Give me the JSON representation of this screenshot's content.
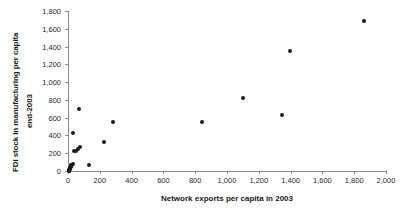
{
  "chart_data": {
    "type": "scatter",
    "title": "",
    "xlabel": "Network exports per capita in 2003",
    "ylabel_line1": "FDI stock in manufacturing per capita",
    "ylabel_line2": "end-2003",
    "xlim": [
      0,
      2000
    ],
    "ylim": [
      0,
      1800
    ],
    "xticks": [
      0,
      200,
      400,
      600,
      800,
      1000,
      1200,
      1400,
      1600,
      1800,
      2000
    ],
    "xticklabels": [
      "0",
      "200",
      "400",
      "600",
      "800",
      "1,000",
      "1,200",
      "1,400",
      "1,600",
      "1,800",
      "2,000"
    ],
    "yticks": [
      0,
      200,
      400,
      600,
      800,
      1000,
      1200,
      1400,
      1600,
      1800
    ],
    "yticklabels": [
      "0",
      "200",
      "400",
      "600",
      "800",
      "1,000",
      "1,200",
      "1,400",
      "1,600",
      "1,800"
    ],
    "grid": false,
    "legend": false,
    "marker": "filled-circle",
    "marker_color": "#1a1a1a",
    "points": [
      {
        "x": 1860,
        "y": 1690
      },
      {
        "x": 1395,
        "y": 1345
      },
      {
        "x": 1100,
        "y": 825
      },
      {
        "x": 1345,
        "y": 625
      },
      {
        "x": 845,
        "y": 550
      },
      {
        "x": 285,
        "y": 550
      },
      {
        "x": 70,
        "y": 700
      },
      {
        "x": 30,
        "y": 430
      },
      {
        "x": 225,
        "y": 325
      },
      {
        "x": 75,
        "y": 270
      },
      {
        "x": 60,
        "y": 245
      },
      {
        "x": 48,
        "y": 230
      },
      {
        "x": 40,
        "y": 222
      },
      {
        "x": 130,
        "y": 65
      },
      {
        "x": 30,
        "y": 80
      },
      {
        "x": 25,
        "y": 70
      },
      {
        "x": 22,
        "y": 62
      },
      {
        "x": 18,
        "y": 55
      },
      {
        "x": 16,
        "y": 45
      },
      {
        "x": 14,
        "y": 38
      },
      {
        "x": 12,
        "y": 30
      },
      {
        "x": 11,
        "y": 24
      },
      {
        "x": 10,
        "y": 18
      },
      {
        "x": 9,
        "y": 12
      },
      {
        "x": 8,
        "y": 8
      },
      {
        "x": 7,
        "y": 5
      },
      {
        "x": 6,
        "y": 3
      },
      {
        "x": 5,
        "y": 2
      }
    ]
  }
}
